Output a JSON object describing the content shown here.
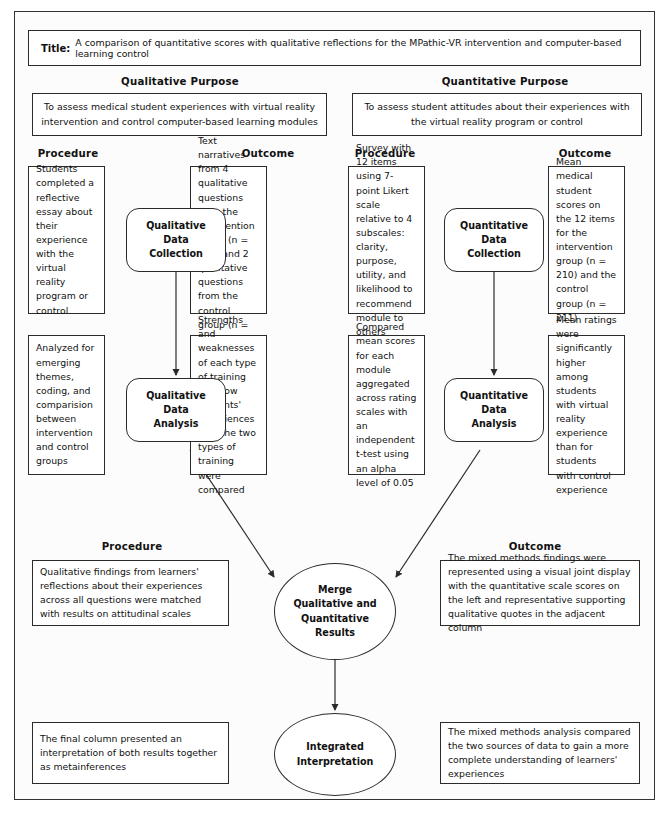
{
  "title": {
    "label": "Title:",
    "text": "A comparison of quantitative scores with qualitative reflections for the MPathic-VR intervention and computer-based learning control"
  },
  "purposes": {
    "qualitative": {
      "heading": "Qualitative Purpose",
      "text": "To assess medical student experiences with virtual reality intervention and control computer-based learning modules"
    },
    "quantitative": {
      "heading": "Quantitative Purpose",
      "text": "To assess student attitudes about their experiences with the virtual reality program or control"
    }
  },
  "headers": {
    "qual_procedure": "Procedure",
    "qual_outcome": "Outcome",
    "quant_procedure": "Procedure",
    "quant_outcome": "Outcome",
    "merge_procedure": "Procedure",
    "merge_outcome": "Outcome"
  },
  "nodes": {
    "qual_collection": "Qualitative\nData\nCollection",
    "qual_analysis": "Qualitative\nData\nAnalysis",
    "quant_collection": "Quantitative\nData\nCollection",
    "quant_analysis": "Quantitative\nData\nAnalysis",
    "merge": "Merge\nQualitative and\nQuantitative\nResults",
    "integrated": "Integrated\nInterpretation"
  },
  "boxes": {
    "qual_collection_procedure": "Students completed a reflective essay about their experience with the virtual reality program or control",
    "qual_collection_outcome": "Text narratives from 4 qualitative questions from the intervention group (n = 210) and 2 qualitative questions from the control group (n = 211)",
    "quant_collection_procedure": "Survey with 12 items using 7-point Likert scale relative to 4 subscales: clarity, purpose, utility, and likelihood to recommend module to others",
    "quant_collection_outcome": "Mean medical student scores on the 12 items for the intervention group (n = 210) and the control group (n = 211)",
    "qual_analysis_procedure": "Analyzed for emerging themes, coding, and comparision between intervention and control groups",
    "qual_analysis_outcome": "Strengths and weaknesses of each type of training and how students' experiences with the two types of training were compared",
    "quant_analysis_procedure": "Compared mean scores for each module aggregated across rating scales with an independent t-test using an alpha level of 0.05",
    "quant_analysis_outcome": "Mean ratings were significantly higher among students with virtual reality experience than for students with control experience",
    "merge_procedure": "Qualitative findings from learners' reflections about their experiences across all questions were matched with results on attitudinal scales",
    "merge_outcome": "The mixed methods findings were represented using a visual joint display with the quantitative scale scores on the left and representative supporting qualitative quotes in the adjacent column",
    "integrated_procedure": "The final column presented an interpretation of both results together as metainferences",
    "integrated_outcome": "The mixed methods analysis compared the two sources of data to gain a more complete understanding of learners' experiences"
  },
  "colors": {
    "stroke": "#2b2b2b",
    "background": "#fcfcfc",
    "box_fill": "#ffffff"
  }
}
